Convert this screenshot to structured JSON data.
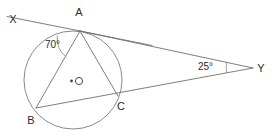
{
  "figure": {
    "background_color": "#ffffff",
    "line_color": "#6f6f6f",
    "circle_color": "#8a8a8a",
    "label_color": "#2b2b2b",
    "width": 278,
    "height": 136
  },
  "circle": {
    "center_label": "O",
    "center_x": 73,
    "center_y": 80,
    "radius": 49
  },
  "points": {
    "X": {
      "label": "X",
      "x": 8,
      "y": 17,
      "label_x": 13,
      "label_y": 23
    },
    "A": {
      "label": "A",
      "x": 80,
      "y": 31,
      "label_x": 79,
      "label_y": 16
    },
    "B": {
      "label": "B",
      "x": 36,
      "y": 108,
      "label_x": 31,
      "label_y": 124
    },
    "C": {
      "label": "C",
      "x": 118,
      "y": 96,
      "label_x": 121,
      "label_y": 110
    },
    "Y": {
      "label": "Y",
      "x": 253,
      "y": 68,
      "label_x": 261,
      "label_y": 72
    },
    "O": {
      "label": "O",
      "x": 73,
      "y": 80,
      "label_x": 77,
      "label_y": 85
    }
  },
  "angles": [
    {
      "name": "tangent-chord-angle",
      "label": "70°",
      "value": 70,
      "unit": "degrees",
      "at_vertex": "A",
      "label_x": 45,
      "label_y": 48
    },
    {
      "name": "external-angle",
      "label": "25°",
      "value": 25,
      "unit": "degrees",
      "at_vertex": "Y",
      "label_x": 198,
      "label_y": 70
    }
  ],
  "segments": [
    {
      "name": "tangent-line-XA",
      "from": "X",
      "to": "A",
      "extends_past": true
    },
    {
      "name": "chord-AB",
      "from": "A",
      "to": "B"
    },
    {
      "name": "chord-AC",
      "from": "A",
      "to": "C"
    },
    {
      "name": "line-AY",
      "from": "A",
      "to": "Y"
    },
    {
      "name": "secant-BCY",
      "from": "B",
      "to": "Y"
    }
  ]
}
